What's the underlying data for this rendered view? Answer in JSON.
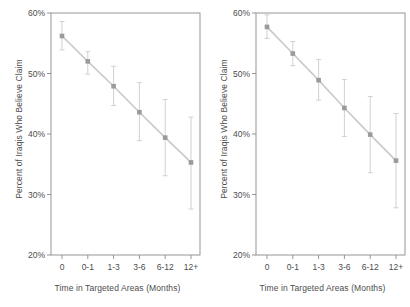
{
  "figure": {
    "background": "#ffffff",
    "marker_color": "#9a9a9a",
    "line_color": "#c9c9c9",
    "errorbar_color": "#cccccc",
    "axis_color": "#8a8a8a",
    "text_color": "#4d4d4d"
  },
  "chart_data": [
    {
      "type": "line",
      "panel": "left",
      "title": "",
      "xlabel": "Time in Targeted Areas (Months)",
      "ylabel": "Percent of Iraqis Who Believe Claim",
      "categories": [
        "0",
        "0-1",
        "1-3",
        "3-6",
        "6-12",
        "12+"
      ],
      "values": [
        56.2,
        52.0,
        47.9,
        43.6,
        39.4,
        35.3
      ],
      "error_low": [
        53.9,
        49.9,
        44.7,
        38.9,
        33.1,
        27.6
      ],
      "error_high": [
        58.6,
        53.6,
        51.2,
        48.5,
        45.7,
        42.8
      ],
      "ylim": [
        20,
        60
      ],
      "yticks": [
        20,
        30,
        40,
        50,
        60
      ],
      "ytick_labels": [
        "20%",
        "30%",
        "40%",
        "50%",
        "60%"
      ],
      "grid": false,
      "legend": "none"
    },
    {
      "type": "line",
      "panel": "right",
      "title": "",
      "xlabel": "Time in Targeted Areas (Months)",
      "ylabel": "Percent of Iraqis Who Believe Claim",
      "categories": [
        "0",
        "0-1",
        "1-3",
        "3-6",
        "6-12",
        "12+"
      ],
      "values": [
        57.7,
        53.3,
        48.9,
        44.3,
        39.9,
        35.6
      ],
      "error_low": [
        55.8,
        51.3,
        45.6,
        39.6,
        33.6,
        27.8
      ],
      "error_high": [
        59.7,
        55.3,
        52.3,
        49.0,
        46.2,
        43.4
      ],
      "ylim": [
        20,
        60
      ],
      "yticks": [
        20,
        30,
        40,
        50,
        60
      ],
      "ytick_labels": [
        "20%",
        "30%",
        "40%",
        "50%",
        "60%"
      ],
      "grid": false,
      "legend": "none"
    }
  ]
}
